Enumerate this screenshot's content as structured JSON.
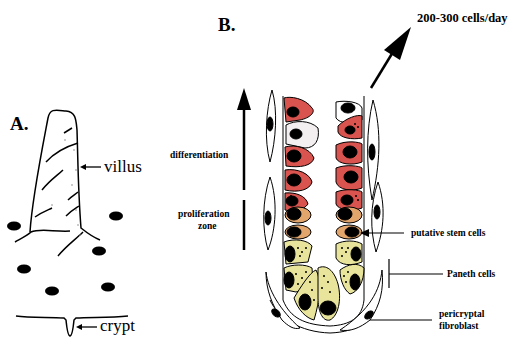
{
  "panel_a": {
    "label": "A.",
    "villus_label": "villus",
    "crypt_label": "crypt"
  },
  "panel_b": {
    "label": "B.",
    "output_rate": "200-300 cells/day",
    "differentiation_label": "differentiation",
    "proliferation_label_line1": "proliferation",
    "proliferation_label_line2": "zone",
    "stem_cells_label": "putative stem cells",
    "paneth_label": "Paneth cells",
    "fibroblast_label_line1": "pericryptal",
    "fibroblast_label_line2": "fibroblast"
  },
  "colors": {
    "differentiated_cell": "#d9534f",
    "stem_cell": "#e2a56c",
    "paneth_cell": "#e8e49c",
    "nucleus": "#000000",
    "outline": "#000000"
  }
}
